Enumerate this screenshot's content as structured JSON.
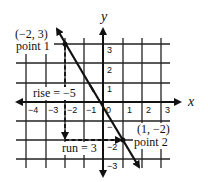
{
  "diagram": {
    "axes": {
      "x_label": "x",
      "y_label": "y"
    },
    "x_ticks": [
      "−4",
      "−3",
      "−2",
      "−1",
      "0",
      "1",
      "2",
      "3"
    ],
    "y_ticks": [
      "3",
      "2",
      "1",
      "−",
      "−2",
      "−3"
    ],
    "point1": {
      "coords": "(−2, 3)",
      "name": "point 1"
    },
    "point2": {
      "coords": "(1, −2)",
      "name": "point 2"
    },
    "rise_label": "rise = −5",
    "run_label": "run = 3",
    "colors": {
      "ink": "#111111",
      "background": "#ffffff"
    }
  }
}
